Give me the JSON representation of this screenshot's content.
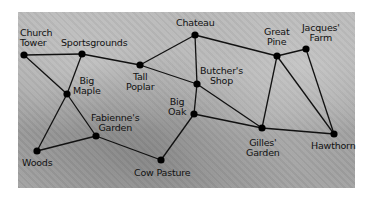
{
  "diagram": {
    "type": "graph-on-aerial-photo",
    "background": "grayscale aerial village photo",
    "nodes": [
      {
        "id": "church_tower",
        "label": "Church\nTower",
        "x": 24,
        "y": 55,
        "lx": 20,
        "ly": 28,
        "align": "left"
      },
      {
        "id": "sportsgrounds",
        "label": "Sportsgrounds",
        "x": 82,
        "y": 54,
        "lx": 62,
        "ly": 38,
        "align": "left"
      },
      {
        "id": "big_maple",
        "label": "Big\nMaple",
        "x": 67,
        "y": 94,
        "lx": 73,
        "ly": 76,
        "align": "center"
      },
      {
        "id": "tall_poplar",
        "label": "Tall\nPoplar",
        "x": 140,
        "y": 65,
        "lx": 126,
        "ly": 72,
        "align": "center"
      },
      {
        "id": "chateau",
        "label": "Chateau",
        "x": 195,
        "y": 35,
        "lx": 176,
        "ly": 19,
        "align": "left"
      },
      {
        "id": "butchers_shop",
        "label": "Butcher's\nShop",
        "x": 197,
        "y": 84,
        "lx": 201,
        "ly": 66,
        "align": "center"
      },
      {
        "id": "big_oak",
        "label": "Big\nOak",
        "x": 194,
        "y": 114,
        "lx": 168,
        "ly": 97,
        "align": "center"
      },
      {
        "id": "fabiennes_garden",
        "label": "Fabienne's\nGarden",
        "x": 96,
        "y": 136,
        "lx": 92,
        "ly": 113,
        "align": "center"
      },
      {
        "id": "woods",
        "label": "Woods",
        "x": 37,
        "y": 151,
        "lx": 22,
        "ly": 158,
        "align": "left"
      },
      {
        "id": "cow_pasture",
        "label": "Cow Pasture",
        "x": 161,
        "y": 160,
        "lx": 135,
        "ly": 168,
        "align": "left"
      },
      {
        "id": "great_pine",
        "label": "Great\nPine",
        "x": 277,
        "y": 56,
        "lx": 264,
        "ly": 27,
        "align": "center"
      },
      {
        "id": "jacques_farm",
        "label": "Jacques'\nFarm",
        "x": 306,
        "y": 49,
        "lx": 303,
        "ly": 23,
        "align": "center"
      },
      {
        "id": "gilles_garden",
        "label": "Gilles'\nGarden",
        "x": 262,
        "y": 128,
        "lx": 246,
        "ly": 138,
        "align": "center"
      },
      {
        "id": "hawthorn",
        "label": "Hawthorn",
        "x": 334,
        "y": 134,
        "lx": 312,
        "ly": 141,
        "align": "left"
      }
    ],
    "edges": [
      [
        "church_tower",
        "sportsgrounds"
      ],
      [
        "church_tower",
        "big_maple"
      ],
      [
        "sportsgrounds",
        "big_maple"
      ],
      [
        "sportsgrounds",
        "tall_poplar"
      ],
      [
        "big_maple",
        "woods"
      ],
      [
        "big_maple",
        "fabiennes_garden"
      ],
      [
        "woods",
        "fabiennes_garden"
      ],
      [
        "fabiennes_garden",
        "cow_pasture"
      ],
      [
        "tall_poplar",
        "chateau"
      ],
      [
        "tall_poplar",
        "butchers_shop"
      ],
      [
        "chateau",
        "butchers_shop"
      ],
      [
        "chateau",
        "great_pine"
      ],
      [
        "butchers_shop",
        "big_oak"
      ],
      [
        "butchers_shop",
        "gilles_garden"
      ],
      [
        "big_oak",
        "cow_pasture"
      ],
      [
        "big_oak",
        "gilles_garden"
      ],
      [
        "great_pine",
        "jacques_farm"
      ],
      [
        "great_pine",
        "gilles_garden"
      ],
      [
        "great_pine",
        "hawthorn"
      ],
      [
        "jacques_farm",
        "hawthorn"
      ],
      [
        "gilles_garden",
        "hawthorn"
      ]
    ]
  },
  "labels": {
    "church_tower": "Church\nTower",
    "sportsgrounds": "Sportsgrounds",
    "big_maple": "Big\nMaple",
    "tall_poplar": "Tall\nPoplar",
    "chateau": "Chateau",
    "butchers_shop": "Butcher's\nShop",
    "big_oak": "Big\nOak",
    "fabiennes_garden": "Fabienne's\nGarden",
    "woods": "Woods",
    "cow_pasture": "Cow Pasture",
    "great_pine": "Great\nPine",
    "jacques_farm": "Jacques'\nFarm",
    "gilles_garden": "Gilles'\nGarden",
    "hawthorn": "Hawthorn"
  },
  "colors": {
    "edge": "#111111",
    "node": "#000000",
    "text": "#111111"
  }
}
